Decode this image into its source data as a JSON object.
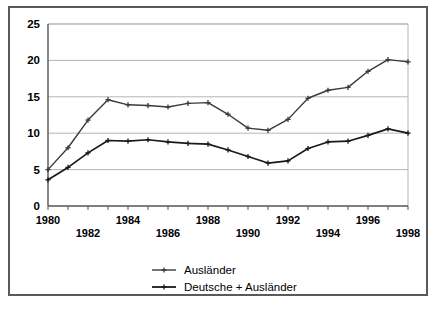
{
  "chart_data": {
    "type": "line",
    "title": "",
    "subtitle": "",
    "xlabel": "",
    "ylabel": "",
    "xlim": [
      1980,
      1998
    ],
    "ylim": [
      0,
      25
    ],
    "grid": true,
    "grid_axis": "y",
    "legend_position": "bottom",
    "x": [
      1980,
      1981,
      1982,
      1983,
      1984,
      1985,
      1986,
      1987,
      1988,
      1989,
      1990,
      1991,
      1992,
      1993,
      1994,
      1995,
      1996,
      1997,
      1998
    ],
    "y_ticks": [
      0,
      5,
      10,
      15,
      20,
      25
    ],
    "y_tick_labels": [
      "0",
      "5",
      "10",
      "15",
      "20",
      "25"
    ],
    "x_ticks": [
      1980,
      1981,
      1982,
      1983,
      1984,
      1985,
      1986,
      1987,
      1988,
      1989,
      1990,
      1991,
      1992,
      1993,
      1994,
      1995,
      1996,
      1997,
      1998
    ],
    "x_tick_labels_row1": [
      {
        "year": 1980,
        "label": "1980"
      },
      {
        "year": 1984,
        "label": "1984"
      },
      {
        "year": 1988,
        "label": "1988"
      },
      {
        "year": 1992,
        "label": "1992"
      },
      {
        "year": 1996,
        "label": "1996"
      }
    ],
    "x_tick_labels_row2": [
      {
        "year": 1982,
        "label": "1982"
      },
      {
        "year": 1986,
        "label": "1986"
      },
      {
        "year": 1990,
        "label": "1990"
      },
      {
        "year": 1994,
        "label": "1994"
      },
      {
        "year": 1998,
        "label": "1998"
      }
    ],
    "series": [
      {
        "name": "Ausländer",
        "color": "#3a3a3a",
        "marker": "plus",
        "values": [
          5.0,
          8.0,
          11.8,
          14.6,
          13.9,
          13.8,
          13.6,
          14.1,
          14.2,
          12.6,
          10.7,
          10.4,
          11.9,
          14.8,
          15.9,
          16.3,
          18.5,
          20.1,
          19.8
        ]
      },
      {
        "name": "Deutsche + Ausländer",
        "color": "#1a1a1a",
        "marker": "plus",
        "values": [
          3.6,
          5.3,
          7.3,
          9.0,
          8.9,
          9.1,
          8.8,
          8.6,
          8.5,
          7.7,
          6.8,
          5.9,
          6.2,
          7.9,
          8.8,
          8.9,
          9.7,
          10.6,
          10.0
        ]
      }
    ],
    "legend": [
      {
        "label": "Ausländer",
        "color": "#3a3a3a"
      },
      {
        "label": "Deutsche + Ausländer",
        "color": "#1a1a1a"
      }
    ],
    "axis_color": "#555555",
    "gridline_color": "#b5b5b5",
    "frame_color": "#5a5a5a",
    "background_color": "#ffffff"
  }
}
